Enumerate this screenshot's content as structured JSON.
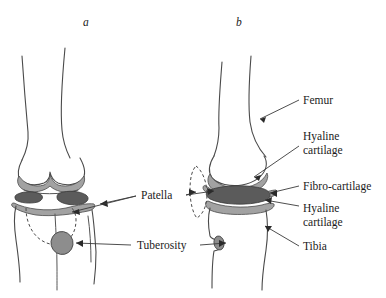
{
  "figure": {
    "panels": [
      {
        "id": "panel-a",
        "label": "a",
        "view": "anterior",
        "x": 83,
        "y": 26
      },
      {
        "id": "panel-b",
        "label": "b",
        "view": "lateral",
        "x": 236,
        "y": 26
      }
    ],
    "annotations": [
      {
        "id": "femur",
        "text": "Femur",
        "lines": [
          "Femur"
        ],
        "x": 303,
        "y": 104,
        "anchor": "start",
        "panel": "b"
      },
      {
        "id": "hyaline-upper",
        "text": "Hyaline cartilage",
        "lines": [
          "Hyaline",
          "cartilage"
        ],
        "x": 303,
        "y": 140,
        "anchor": "start",
        "panel": "b"
      },
      {
        "id": "fibro-cartilage",
        "text": "Fibro-cartilage",
        "lines": [
          "Fibro-cartilage"
        ],
        "x": 303,
        "y": 185,
        "anchor": "start",
        "panel": "b"
      },
      {
        "id": "hyaline-lower",
        "text": "Hyaline cartilage",
        "lines": [
          "Hyaline",
          "cartilage"
        ],
        "x": 303,
        "y": 208,
        "anchor": "start",
        "panel": "b"
      },
      {
        "id": "tibia",
        "text": "Tibia",
        "lines": [
          "Tibia"
        ],
        "x": 303,
        "y": 248,
        "anchor": "start",
        "panel": "b"
      },
      {
        "id": "patella",
        "text": "Patella",
        "lines": [
          "Patella"
        ],
        "x": 141,
        "y": 199,
        "anchor": "start",
        "panel": "both"
      },
      {
        "id": "tuberosity",
        "text": "Tuberosity",
        "lines": [
          "Tuberosity"
        ],
        "x": 137,
        "y": 248,
        "anchor": "start",
        "panel": "both"
      }
    ],
    "colors": {
      "outline": "#4a4a4a",
      "hyaline_cartilage": "#a2a2a2",
      "fibro_cartilage": "#5b5b5b",
      "tuberosity": "#8d8d8d",
      "text": "#1b1b1b",
      "background": "#ffffff"
    },
    "structures": [
      {
        "name": "femur",
        "panels": [
          "a",
          "b"
        ]
      },
      {
        "name": "tibia",
        "panels": [
          "a",
          "b"
        ]
      },
      {
        "name": "patella",
        "panels": [
          "a",
          "b"
        ],
        "style": "dashed-outline"
      },
      {
        "name": "hyaline-cartilage",
        "panels": [
          "a",
          "b"
        ],
        "fill": "#a2a2a2"
      },
      {
        "name": "fibro-cartilage",
        "panels": [
          "a",
          "b"
        ],
        "fill": "#5b5b5b"
      },
      {
        "name": "tibial-tuberosity",
        "panels": [
          "a",
          "b"
        ],
        "fill": "#8d8d8d"
      }
    ]
  }
}
